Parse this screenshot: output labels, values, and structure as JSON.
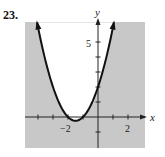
{
  "problem_number": "23.",
  "colors": {
    "shade": "#c8c8c8",
    "curve": "#111111",
    "axis": "#222222"
  },
  "chart_data": {
    "type": "line",
    "title": "",
    "function": "y = x^2 + 3x + 2",
    "inequality_shading": "outside the parabola (region below/around the curve) shaded gray",
    "xlabel": "x",
    "ylabel": "y",
    "xlim": [
      -4.8,
      3.2
    ],
    "ylim": [
      -2,
      6.3
    ],
    "x_tick_labels": [
      "-2",
      "2"
    ],
    "y_tick_labels": [
      "5"
    ],
    "x_ticks": [
      -4,
      -3,
      -2,
      -1,
      1,
      2
    ],
    "y_ticks": [
      -1,
      1,
      2,
      3,
      4,
      5
    ],
    "vertex": [
      -1.5,
      -0.25
    ],
    "x_intercepts": [
      -2,
      -1
    ],
    "y_intercept": 2,
    "grid": false,
    "legend": null
  },
  "labels": {
    "x_axis": "x",
    "y_axis": "y",
    "tick_neg2": "−2",
    "tick_2": "2",
    "tick_5": "5"
  }
}
